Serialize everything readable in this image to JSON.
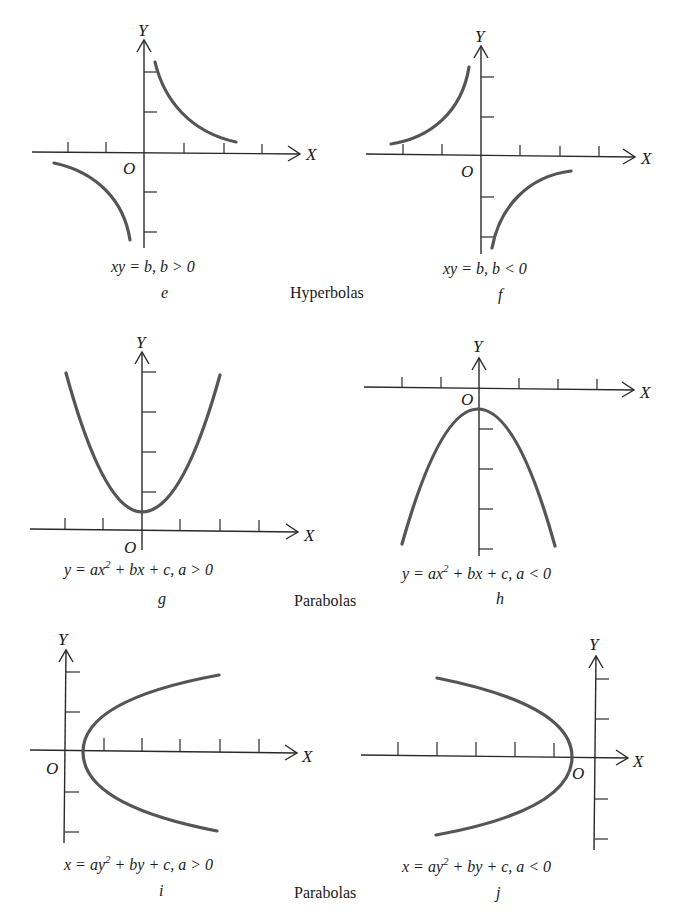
{
  "figure": {
    "groups": [
      {
        "title": "Hyperbolas"
      },
      {
        "title": "Parabolas"
      },
      {
        "title": "Parabolas"
      }
    ],
    "axis_labels": {
      "x": "X",
      "y": "Y",
      "origin": "O"
    },
    "panels": [
      {
        "id": "e",
        "letter": "e",
        "equation_main": "xy = b,  b > 0",
        "type": "hyperbola"
      },
      {
        "id": "f",
        "letter": "f",
        "equation_main": "xy = b,  b < 0",
        "type": "hyperbola"
      },
      {
        "id": "g",
        "letter": "g",
        "eq_pre": "y = ax",
        "eq_sup": "2",
        "eq_post": " + bx + c,  a > 0",
        "type": "parabola-up"
      },
      {
        "id": "h",
        "letter": "h",
        "eq_pre": "y = ax",
        "eq_sup": "2",
        "eq_post": " + bx + c,  a < 0",
        "type": "parabola-down"
      },
      {
        "id": "i",
        "letter": "i",
        "eq_pre": "x = ay",
        "eq_sup": "2",
        "eq_post": " + by + c,  a > 0",
        "type": "parabola-right"
      },
      {
        "id": "j",
        "letter": "j",
        "eq_pre": "x = ay",
        "eq_sup": "2",
        "eq_post": " + by + c,  a < 0",
        "type": "parabola-left"
      }
    ],
    "colors": {
      "axis": "#2a2a2a",
      "curve": "#555555",
      "text": "#1a1a1a"
    }
  }
}
